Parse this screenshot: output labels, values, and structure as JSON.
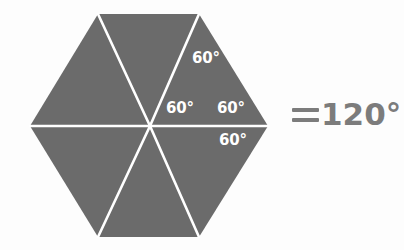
{
  "figure": {
    "shape_name": "hexagon",
    "fill_color": "#6b6b6b",
    "line_color": "#ffffff",
    "background_color": "#fdfdfd",
    "accent_text_color": "#7c7c7c",
    "center": {
      "x": 150,
      "y": 126
    },
    "vertices": [
      {
        "x": 30,
        "y": 126
      },
      {
        "x": 98,
        "y": 14
      },
      {
        "x": 199,
        "y": 14
      },
      {
        "x": 268,
        "y": 126
      },
      {
        "x": 199,
        "y": 237
      },
      {
        "x": 98,
        "y": 237
      }
    ],
    "angle_labels": [
      {
        "text": "60°",
        "x": 192,
        "y": 51
      },
      {
        "text": "60°",
        "x": 166,
        "y": 101
      },
      {
        "text": "60°",
        "x": 217,
        "y": 101
      },
      {
        "text": "60°",
        "x": 219,
        "y": 133
      }
    ]
  },
  "result": {
    "equals_symbol": "=",
    "value": "120°"
  }
}
